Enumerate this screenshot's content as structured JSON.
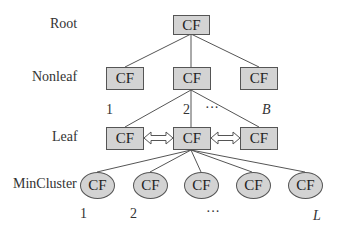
{
  "levels": {
    "root": "Root",
    "nonleaf": "Nonleaf",
    "leaf": "Leaf",
    "mincluster": "MinCluster"
  },
  "node_label": "CF",
  "nonleaf_indices": [
    "1",
    "2",
    "···",
    "B"
  ],
  "mincluster_indices": [
    "1",
    "2",
    "···",
    "L"
  ],
  "colors": {
    "node_fill": "#d3d3d3",
    "node_border": "#555555",
    "edge": "#555555"
  }
}
